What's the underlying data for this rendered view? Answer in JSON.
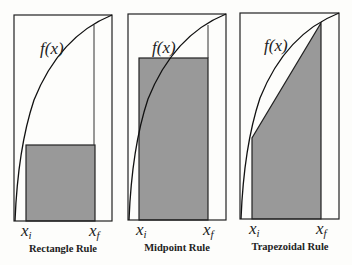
{
  "panels": [
    {
      "title": "Rectangle Rule",
      "function_label": "f(x)",
      "x_start_label": "x",
      "x_start_sub": "i",
      "x_end_label": "x",
      "x_end_sub": "f"
    },
    {
      "title": "Midpoint Rule",
      "function_label": "f(x)",
      "x_start_label": "x",
      "x_start_sub": "i",
      "x_end_label": "x",
      "x_end_sub": "f"
    },
    {
      "title": "Trapezoidal Rule",
      "function_label": "f(x)",
      "x_start_label": "x",
      "x_start_sub": "i",
      "x_end_label": "x",
      "x_end_sub": "f"
    }
  ],
  "colors": {
    "shaded_area": "#999999",
    "stroke": "#222222",
    "background": "#fdfdfb"
  }
}
